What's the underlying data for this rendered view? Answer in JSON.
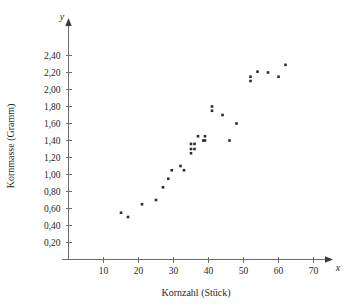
{
  "chart_data": {
    "type": "scatter",
    "title": "",
    "xlabel": "Kornzahl (Stück)",
    "ylabel": "Kornmasse (Gramm)",
    "x_axis_symbol": "x",
    "y_axis_symbol": "y",
    "xlim": [
      0,
      73
    ],
    "ylim": [
      0,
      2.52
    ],
    "grid": false,
    "legend": null,
    "xticks": [
      10,
      20,
      30,
      40,
      50,
      60,
      70
    ],
    "xtick_labels": [
      "10",
      "20",
      "30",
      "40",
      "50",
      "60",
      "70"
    ],
    "yticks": [
      0.2,
      0.4,
      0.6,
      0.8,
      1.0,
      1.2,
      1.4,
      1.6,
      1.8,
      2.0,
      2.2,
      2.4
    ],
    "ytick_labels": [
      "0,20",
      "0,40",
      "0,60",
      "0,80",
      "1,00",
      "1,20",
      "1,40",
      "1,60",
      "1,80",
      "2,00",
      "2,20",
      "2,40"
    ],
    "decimal_separator": ",",
    "point_count": 27,
    "points": [
      {
        "x": 15,
        "y": 0.55
      },
      {
        "x": 17,
        "y": 0.5
      },
      {
        "x": 21,
        "y": 0.65
      },
      {
        "x": 25,
        "y": 0.7
      },
      {
        "x": 27,
        "y": 0.85
      },
      {
        "x": 28.5,
        "y": 0.95
      },
      {
        "x": 29.5,
        "y": 1.05
      },
      {
        "x": 32,
        "y": 1.1
      },
      {
        "x": 33,
        "y": 1.05
      },
      {
        "x": 35,
        "y": 1.25
      },
      {
        "x": 35,
        "y": 1.3
      },
      {
        "x": 35,
        "y": 1.36
      },
      {
        "x": 36,
        "y": 1.3
      },
      {
        "x": 36,
        "y": 1.36
      },
      {
        "x": 37,
        "y": 1.45
      },
      {
        "x": 38.5,
        "y": 1.4
      },
      {
        "x": 39,
        "y": 1.45
      },
      {
        "x": 39,
        "y": 1.4
      },
      {
        "x": 41,
        "y": 1.8
      },
      {
        "x": 41,
        "y": 1.75
      },
      {
        "x": 44,
        "y": 1.7
      },
      {
        "x": 46,
        "y": 1.4
      },
      {
        "x": 48,
        "y": 1.6
      },
      {
        "x": 52,
        "y": 2.15
      },
      {
        "x": 52,
        "y": 2.1
      },
      {
        "x": 54,
        "y": 2.21
      },
      {
        "x": 57,
        "y": 2.2
      },
      {
        "x": 60,
        "y": 2.15
      },
      {
        "x": 62,
        "y": 2.29
      }
    ]
  }
}
